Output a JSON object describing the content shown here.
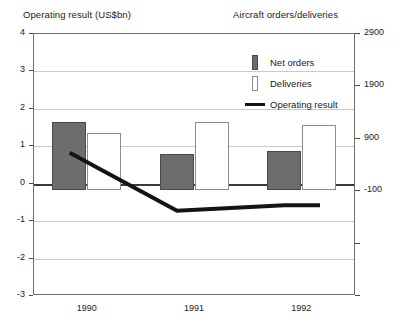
{
  "chart_data": {
    "type": "bar",
    "title": "",
    "left_axis_title": "Operating result (US$bn)",
    "right_axis_title": "Aircraft orders/deliveries",
    "xlabel": "",
    "categories": [
      "1990",
      "1991",
      "1992"
    ],
    "grid": true,
    "legend_position": "inside-top-right",
    "left_axis": {
      "label": "Operating result (US$bn)",
      "ticks": [
        "4",
        "3",
        "2",
        "1",
        "0",
        "-1",
        "-2",
        "-3"
      ],
      "tick_values": [
        4,
        3,
        2,
        1,
        0,
        -1,
        -2,
        -3
      ],
      "ylim": [
        -3,
        4
      ]
    },
    "right_axis": {
      "label": "Aircraft orders/deliveries",
      "ticks": [
        "2900",
        "1900",
        "900",
        "-100"
      ],
      "tick_values": [
        2900,
        1900,
        900,
        -100
      ],
      "ylim": [
        -2100,
        2900
      ]
    },
    "series": [
      {
        "name": "Net orders",
        "axis": "right",
        "type": "bar",
        "color": "#6d6d6d",
        "values": [
          1200,
          600,
          650
        ]
      },
      {
        "name": "Deliveries",
        "axis": "right",
        "type": "bar",
        "color": "#ffffff",
        "values": [
          1000,
          1200,
          1150
        ]
      },
      {
        "name": "Operating result",
        "axis": "left",
        "type": "line",
        "color": "#141414",
        "values": [
          0.8,
          -0.75,
          -0.6
        ]
      }
    ]
  },
  "legend": {
    "items": [
      {
        "label": "Net orders",
        "swatch": "dark-square"
      },
      {
        "label": "Deliveries",
        "swatch": "white-square"
      },
      {
        "label": "Operating result",
        "swatch": "black-line"
      }
    ]
  },
  "caption": ""
}
